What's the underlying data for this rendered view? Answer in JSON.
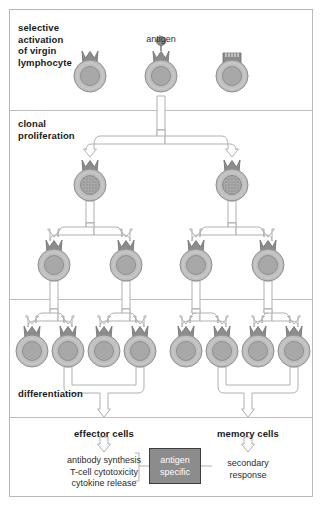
{
  "figure": {
    "type": "biology-process-diagram"
  },
  "sections": [
    {
      "id": "selective-activation",
      "label": "selective\nactivation\nof virgin\nlymphocyte",
      "x": 18,
      "y": 22
    },
    {
      "id": "clonal-proliferation",
      "label": "clonal\nproliferation",
      "x": 18,
      "y": 118
    },
    {
      "id": "differentiation",
      "label": "differentiation",
      "x": 18,
      "y": 388
    }
  ],
  "dividers": [
    110,
    299,
    417
  ],
  "antigen": {
    "label": "antigen",
    "x": 161,
    "y": 34
  },
  "top_cells": [
    {
      "id": "virgin-lymphocyte-left",
      "cx": 90,
      "cy": 76,
      "receptor": "v-notch",
      "antigen_bound": false,
      "nucleus": "plain"
    },
    {
      "id": "virgin-lymphocyte-center",
      "cx": 161,
      "cy": 76,
      "receptor": "v-notch",
      "antigen_bound": true,
      "nucleus": "plain"
    },
    {
      "id": "virgin-lymphocyte-right",
      "cx": 232,
      "cy": 76,
      "receptor": "comb",
      "antigen_bound": false,
      "nucleus": "plain"
    }
  ],
  "generation_1": [
    {
      "id": "clone-g1-left",
      "cx": 90,
      "cy": 185,
      "nucleus": "stippled"
    },
    {
      "id": "clone-g1-right",
      "cx": 232,
      "cy": 185,
      "nucleus": "stippled"
    }
  ],
  "generation_2": [
    {
      "id": "clone-g2-1",
      "cx": 54,
      "cy": 265,
      "nucleus": "plain"
    },
    {
      "id": "clone-g2-2",
      "cx": 126,
      "cy": 265,
      "nucleus": "plain"
    },
    {
      "id": "clone-g2-3",
      "cx": 196,
      "cy": 265,
      "nucleus": "plain"
    },
    {
      "id": "clone-g2-4",
      "cx": 268,
      "cy": 265,
      "nucleus": "plain"
    }
  ],
  "generation_3": [
    {
      "id": "clone-g3-1",
      "cx": 32,
      "cy": 351,
      "nucleus": "plain"
    },
    {
      "id": "clone-g3-2",
      "cx": 68,
      "cy": 351,
      "nucleus": "plain"
    },
    {
      "id": "clone-g3-3",
      "cx": 104,
      "cy": 351,
      "nucleus": "plain"
    },
    {
      "id": "clone-g3-4",
      "cx": 140,
      "cy": 351,
      "nucleus": "plain"
    },
    {
      "id": "clone-g3-5",
      "cx": 186,
      "cy": 351,
      "nucleus": "plain"
    },
    {
      "id": "clone-g3-6",
      "cx": 222,
      "cy": 351,
      "nucleus": "plain"
    },
    {
      "id": "clone-g3-7",
      "cx": 258,
      "cy": 351,
      "nucleus": "plain"
    },
    {
      "id": "clone-g3-8",
      "cx": 294,
      "cy": 351,
      "nucleus": "plain"
    }
  ],
  "outcomes": {
    "effector": {
      "heading": "effector cells",
      "heading_x": 104,
      "heading_y": 428,
      "functions": [
        "antibody synthesis",
        "T-cell cytotoxicity",
        "cytokine release"
      ],
      "functions_x": 104,
      "functions_y": 455
    },
    "memory": {
      "heading": "memory cells",
      "heading_x": 248,
      "heading_y": 428,
      "response": "secondary\nresponse",
      "response_x": 248,
      "response_y": 458
    },
    "center_box": {
      "label": "antigen\nspecific",
      "x": 149,
      "y": 448,
      "width": 52,
      "height": 36
    }
  },
  "colors": {
    "cell_body": "#bfbfbf",
    "cell_body_stroke": "#8f8f8f",
    "nucleus": "#a8a8a8",
    "nucleus_stroke": "#8a8a8a",
    "receptor": "#8c8c8c",
    "receptor_stroke": "#6d6d6d",
    "antigen": "#8e8e8e",
    "arrow_fill": "#ffffff",
    "arrow_stroke": "#b0b0b0",
    "box_fill": "#8c8c8c",
    "box_stroke": "#3d3d3d",
    "frame": "#b9b9b9",
    "text": "#1a1a1a"
  }
}
